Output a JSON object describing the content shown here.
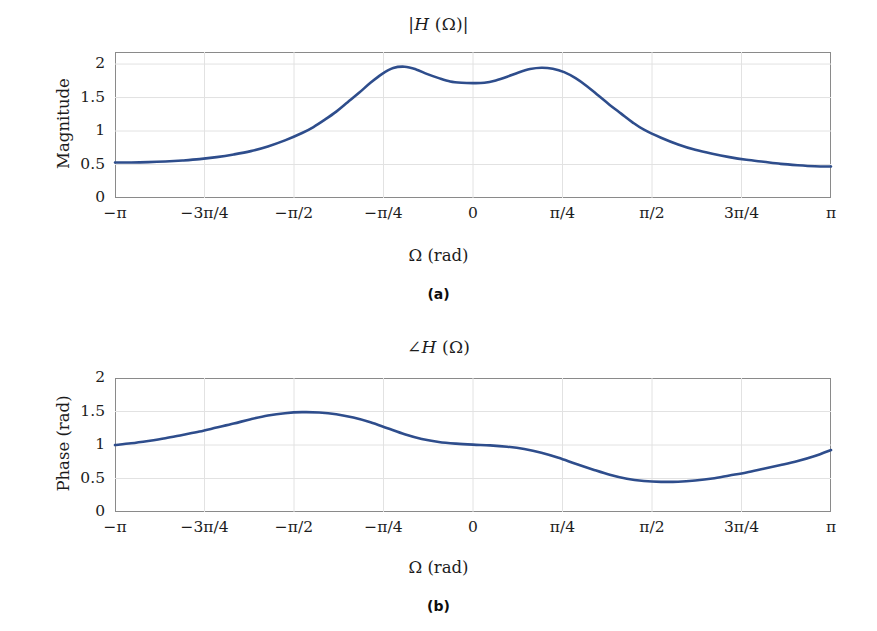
{
  "figure": {
    "background": "#ffffff",
    "line_color": "#2e4d8c",
    "grid_color": "#e2e2e2",
    "frame_color": "#8a8a8a"
  },
  "panels": [
    {
      "id": "a",
      "subcaption": "(a)",
      "title": "|H (Ω)|",
      "title_parts": {
        "pre": "|",
        "italic": "H",
        "post": " (Ω)|"
      },
      "xlabel": "Ω (rad)",
      "ylabel": "Magnitude",
      "yticks": [
        "0",
        "0.5",
        "1",
        "1.5",
        "2"
      ],
      "xticks": [
        "−π",
        "−3π/4",
        "−π/2",
        "−π/4",
        "0",
        "π/4",
        "π/2",
        "3π/4",
        "π"
      ]
    },
    {
      "id": "b",
      "subcaption": "(b)",
      "title": "∠H (Ω)",
      "title_parts": {
        "pre": "∠",
        "italic": "H",
        "post": " (Ω)"
      },
      "xlabel": "Ω (rad)",
      "ylabel": "Phase (rad)",
      "yticks": [
        "0",
        "0.5",
        "1",
        "1.5",
        "2"
      ],
      "xticks": [
        "−π",
        "−3π/4",
        "−π/2",
        "−π/4",
        "0",
        "π/4",
        "π/2",
        "3π/4",
        "π"
      ]
    }
  ],
  "chart_data": [
    {
      "type": "line",
      "title": "|H (Ω)|",
      "subcaption": "(a)",
      "xlabel": "Ω (rad)",
      "ylabel": "Magnitude",
      "xlim": [
        -3.14159265,
        3.14159265
      ],
      "ylim": [
        0,
        2.18
      ],
      "grid": true,
      "legend": "none",
      "xtick_values": [
        -3.14159265,
        -2.35619449,
        -1.57079633,
        -0.78539816,
        0,
        0.78539816,
        1.57079633,
        2.35619449,
        3.14159265
      ],
      "xtick_labels": [
        "−π",
        "−3π/4",
        "−π/2",
        "−π/4",
        "0",
        "π/4",
        "π/2",
        "3π/4",
        "π"
      ],
      "ytick_values": [
        0,
        0.5,
        1,
        1.5,
        2
      ],
      "ytick_labels": [
        "0",
        "0.5",
        "1",
        "1.5",
        "2"
      ],
      "series": [
        {
          "name": "Magnitude",
          "color": "#2e4d8c",
          "x": [
            -3.1416,
            -3.0,
            -2.85,
            -2.7,
            -2.55,
            -2.4,
            -2.25,
            -2.1,
            -1.95,
            -1.8,
            -1.65,
            -1.5,
            -1.4,
            -1.3,
            -1.2,
            -1.1,
            -1.0,
            -0.9,
            -0.8,
            -0.7,
            -0.6,
            -0.5,
            -0.4,
            -0.3,
            -0.2,
            -0.1,
            0.0,
            0.1,
            0.2,
            0.3,
            0.4,
            0.5,
            0.6,
            0.7,
            0.8,
            0.9,
            1.0,
            1.1,
            1.2,
            1.3,
            1.4,
            1.5,
            1.65,
            1.8,
            1.95,
            2.1,
            2.25,
            2.4,
            2.55,
            2.7,
            2.85,
            3.0,
            3.1416
          ],
          "y": [
            0.53,
            0.53,
            0.535,
            0.545,
            0.56,
            0.58,
            0.61,
            0.65,
            0.7,
            0.77,
            0.86,
            0.97,
            1.06,
            1.17,
            1.29,
            1.43,
            1.57,
            1.72,
            1.85,
            1.94,
            1.96,
            1.92,
            1.85,
            1.79,
            1.74,
            1.72,
            1.715,
            1.72,
            1.755,
            1.81,
            1.875,
            1.925,
            1.945,
            1.93,
            1.88,
            1.79,
            1.67,
            1.53,
            1.39,
            1.26,
            1.13,
            1.02,
            0.9,
            0.8,
            0.72,
            0.66,
            0.61,
            0.57,
            0.54,
            0.51,
            0.49,
            0.475,
            0.47
          ]
        }
      ],
      "annotations": [
        {
          "text": "peak",
          "x": -0.6,
          "y": 1.96
        },
        {
          "text": "local minimum",
          "x": 0.0,
          "y": 1.715
        },
        {
          "text": "peak",
          "x": 0.6,
          "y": 1.945
        }
      ]
    },
    {
      "type": "line",
      "title": "∠H (Ω)",
      "subcaption": "(b)",
      "xlabel": "Ω (rad)",
      "ylabel": "Phase (rad)",
      "xlim": [
        -3.14159265,
        3.14159265
      ],
      "ylim": [
        0,
        2.0
      ],
      "grid": true,
      "legend": "none",
      "xtick_values": [
        -3.14159265,
        -2.35619449,
        -1.57079633,
        -0.78539816,
        0,
        0.78539816,
        1.57079633,
        2.35619449,
        3.14159265
      ],
      "xtick_labels": [
        "−π",
        "−3π/4",
        "−π/2",
        "−π/4",
        "0",
        "π/4",
        "π/2",
        "3π/4",
        "π"
      ],
      "ytick_values": [
        0,
        0.5,
        1,
        1.5,
        2
      ],
      "ytick_labels": [
        "0",
        "0.5",
        "1",
        "1.5",
        "2"
      ],
      "series": [
        {
          "name": "Phase",
          "color": "#2e4d8c",
          "x": [
            -3.1416,
            -3.0,
            -2.85,
            -2.7,
            -2.55,
            -2.4,
            -2.25,
            -2.1,
            -1.95,
            -1.8,
            -1.65,
            -1.5,
            -1.35,
            -1.2,
            -1.05,
            -0.9,
            -0.75,
            -0.6,
            -0.45,
            -0.3,
            -0.15,
            0.0,
            0.15,
            0.3,
            0.45,
            0.6,
            0.75,
            0.9,
            1.05,
            1.2,
            1.35,
            1.5,
            1.65,
            1.8,
            1.95,
            2.1,
            2.25,
            2.4,
            2.55,
            2.7,
            2.85,
            3.0,
            3.1416
          ],
          "y": [
            1.0,
            1.025,
            1.06,
            1.1,
            1.15,
            1.2,
            1.26,
            1.32,
            1.385,
            1.44,
            1.475,
            1.49,
            1.485,
            1.46,
            1.41,
            1.34,
            1.25,
            1.16,
            1.09,
            1.045,
            1.02,
            1.005,
            0.995,
            0.975,
            0.94,
            0.885,
            0.81,
            0.72,
            0.635,
            0.555,
            0.495,
            0.463,
            0.45,
            0.452,
            0.47,
            0.5,
            0.545,
            0.59,
            0.645,
            0.7,
            0.76,
            0.835,
            0.925
          ]
        }
      ],
      "annotations": [
        {
          "text": "peak",
          "x": -1.5,
          "y": 1.49
        },
        {
          "text": "plateau",
          "x": 0.0,
          "y": 1.005
        },
        {
          "text": "minimum",
          "x": 1.63,
          "y": 0.45
        }
      ]
    }
  ]
}
